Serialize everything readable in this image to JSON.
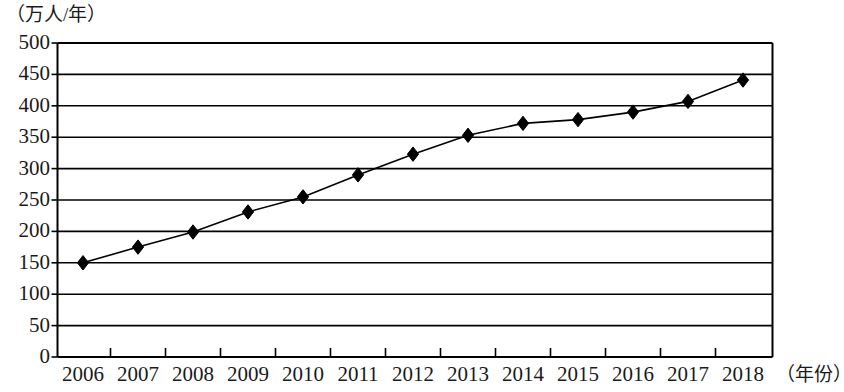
{
  "chart_data": {
    "type": "line",
    "title": "",
    "xlabel": "（年份）",
    "ylabel": "（万人/年）",
    "categories": [
      "2006",
      "2007",
      "2008",
      "2009",
      "2010",
      "2011",
      "2012",
      "2013",
      "2014",
      "2015",
      "2016",
      "2017",
      "2018"
    ],
    "values": [
      150,
      175,
      199,
      231,
      255,
      290,
      323,
      353,
      372,
      378,
      390,
      407,
      441
    ],
    "series": [
      {
        "name": "",
        "values": [
          150,
          175,
          199,
          231,
          255,
          290,
          323,
          353,
          372,
          378,
          390,
          407,
          441
        ],
        "marker": "diamond",
        "color": "#000000"
      }
    ],
    "ylim": [
      0,
      500
    ],
    "y_ticks": [
      "0",
      "50",
      "100",
      "150",
      "200",
      "250",
      "300",
      "350",
      "400",
      "450",
      "500"
    ],
    "y_tick_values": [
      0,
      50,
      100,
      150,
      200,
      250,
      300,
      350,
      400,
      450,
      500
    ],
    "grid": "horizontal",
    "legend": "none",
    "colors": {
      "line": "#000000",
      "marker": "#000000",
      "grid": "#000000",
      "axis": "#000000",
      "background": "#ffffff"
    }
  }
}
